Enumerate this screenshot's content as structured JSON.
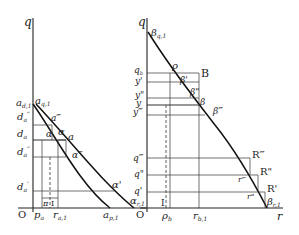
{
  "figure": {
    "type": "economics diagram, two panels",
    "left_panel": {
      "axis_labels": {
        "y": "q",
        "origin": "O"
      },
      "y_ticks": [
        "a_{d,1}",
        "d_a\"",
        "d_a",
        "d_a^‴",
        "d_a'"
      ],
      "x_ticks": [
        "p_a",
        "r_{a,1}",
        "a_{p,1}"
      ],
      "point_labels": [
        "a_{q,1}",
        "a\"",
        "α",
        "a",
        "α\"",
        "α'",
        "α_{r,1}",
        "π",
        "I"
      ],
      "texts": {
        "q": "q",
        "O": "O",
        "ad1_main": "a",
        "ad1_sub": "d,1",
        "aq1_main": "a",
        "aq1_sub": "q,1",
        "da2_main": "d",
        "da2_sub": "a",
        "da2_sup": "\"",
        "da_main": "d",
        "da_sub": "a",
        "da3_main": "d",
        "da3_sub": "a",
        "da3_sup": "‴",
        "da1_main": "d",
        "da1_sub": "a",
        "da1_sup": "'",
        "a_dd": "a‴",
        "alpha_small": "α",
        "alpha": "α",
        "a": "a",
        "alpha3": "α‴",
        "alpha1": "α'",
        "alphar1_main": "α",
        "alphar1_sub": "r,1",
        "pi": "π",
        "I": "I",
        "pa_main": "p",
        "pa_sub": "a",
        "ra1_main": "r",
        "ra1_sub": "a,1",
        "ap1_main": "a",
        "ap1_sub": "p,1"
      }
    },
    "right_panel": {
      "axis_labels": {
        "y": "q",
        "x": "r",
        "origin": "O"
      },
      "y_ticks": [
        "q_b",
        "y'",
        "y\"",
        "y",
        "y‴",
        "q‴",
        "q\"",
        "q'"
      ],
      "x_ticks": [
        "ρ_b",
        "r_{b,1}"
      ],
      "point_labels": [
        "β_{q,1}",
        "ρ",
        "B",
        "β'",
        "β\"",
        "β",
        "β‴",
        "R‴",
        "R\"",
        "R'",
        "r‴",
        "r\"",
        "β_{r,1}",
        "I"
      ],
      "texts": {
        "q": "q",
        "O": "O",
        "r": "r",
        "bq1_main": "β",
        "bq1_sub": "q,1",
        "rho": "ρ",
        "B": "B",
        "qb_main": "q",
        "qb_sub": "b",
        "y1": "y'",
        "y2": "y\"",
        "y": "y",
        "y3": "y‴",
        "b1": "β'",
        "b2": "β\"",
        "b": "β",
        "b3": "β‴",
        "q3": "q‴",
        "q2": "q\"",
        "q1": "q'",
        "R3": "R‴",
        "R2": "R\"",
        "R1": "R'",
        "r3": "r‴",
        "r2": "r\"",
        "br1_main": "β",
        "br1_sub": "r,1",
        "I": "I",
        "rhob_main": "ρ",
        "rhob_sub": "b",
        "rb1_main": "r",
        "rb1_sub": "b,1"
      }
    }
  }
}
